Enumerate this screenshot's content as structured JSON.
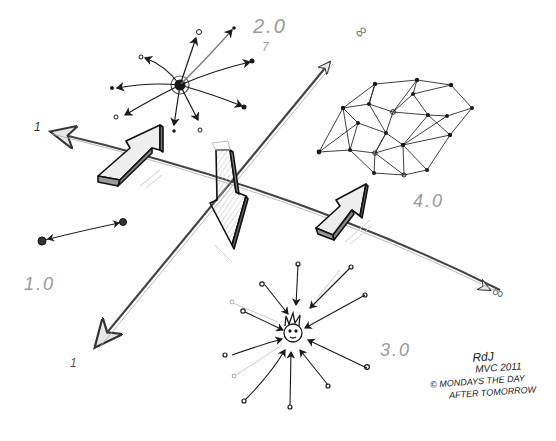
{
  "sketch": {
    "title": "",
    "labels": {
      "web1": "1.0",
      "web2": "2.0",
      "web3": "3.0",
      "web4": "4.0",
      "axis_one_left": "1",
      "axis_one_bottom": "1",
      "axis_inf_top": "∞",
      "axis_inf_right": "∞",
      "seven": "7"
    },
    "signature": {
      "initials": "RdJ",
      "line1": "MVC 2011",
      "line2": "© MONDAYS THE DAY",
      "line3": "AFTER TOMORROW"
    },
    "colors": {
      "ink": "#1a1a1a",
      "pencil": "#9a9a9a",
      "background": "#ffffff",
      "shade": "#d8d8d8"
    }
  }
}
